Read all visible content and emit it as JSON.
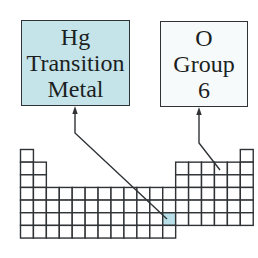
{
  "callouts": [
    {
      "id": "hg",
      "lines": [
        "Hg",
        "Transition",
        "Metal"
      ],
      "fill": "#c4e4ea",
      "target": {
        "row": 6,
        "col": 12
      }
    },
    {
      "id": "o",
      "lines": [
        "O",
        "Group",
        "6"
      ],
      "fill": "#f7fafb",
      "target": {
        "row": 2,
        "col": 16
      }
    }
  ],
  "periodic_table": {
    "rows": 7,
    "cols": 18,
    "layout": [
      [
        1,
        18
      ],
      [
        1,
        2,
        13,
        14,
        15,
        16,
        17,
        18
      ],
      [
        1,
        2,
        13,
        14,
        15,
        16,
        17,
        18
      ],
      [
        1,
        2,
        3,
        4,
        5,
        6,
        7,
        8,
        9,
        10,
        11,
        12,
        13,
        14,
        15,
        16,
        17,
        18
      ],
      [
        1,
        2,
        3,
        4,
        5,
        6,
        7,
        8,
        9,
        10,
        11,
        12,
        13,
        14,
        15,
        16,
        17,
        18
      ],
      [
        1,
        2,
        3,
        4,
        5,
        6,
        7,
        8,
        9,
        10,
        11,
        12,
        13,
        14,
        15,
        16,
        17,
        18
      ],
      [
        1,
        2,
        3,
        4,
        5,
        6,
        7,
        8,
        9,
        10,
        11,
        12
      ]
    ],
    "highlight": {
      "row": 6,
      "col": 12,
      "color": "#b9e0e8"
    }
  },
  "colors": {
    "line": "#2f3336",
    "cell_fill": "#ffffff"
  }
}
